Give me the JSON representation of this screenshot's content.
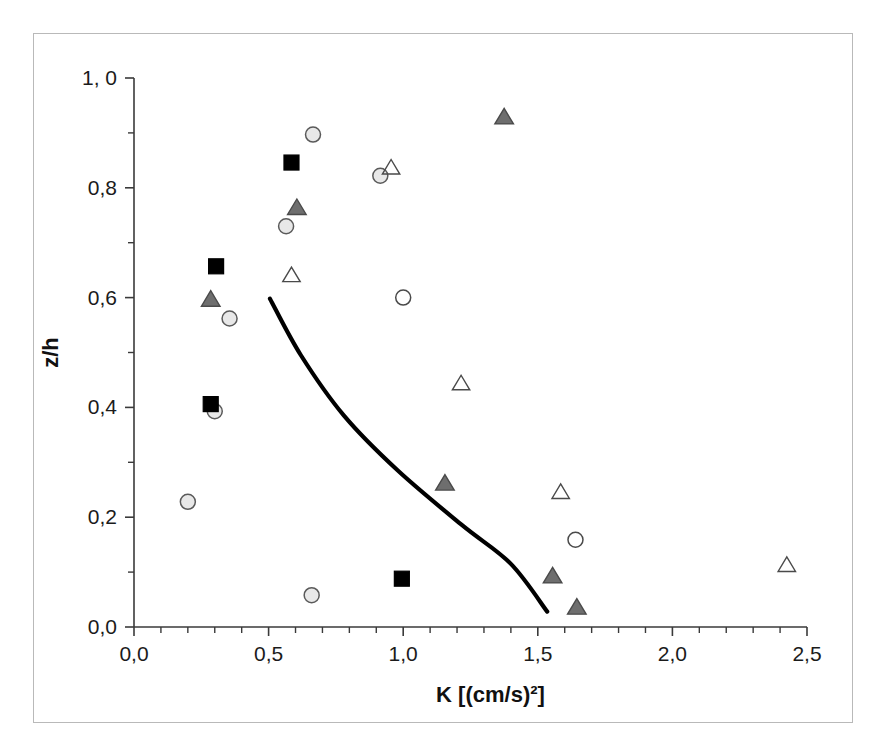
{
  "figure": {
    "background_color": "#ffffff",
    "frame_color": "#b9b9b9"
  },
  "chart_data": {
    "type": "scatter",
    "title": "",
    "subtitle": "",
    "xlabel": "K [(cm/s)²]",
    "ylabel": "z/h",
    "xlim": [
      0.0,
      2.5
    ],
    "ylim": [
      0.0,
      1.0
    ],
    "grid": false,
    "legend": null,
    "x_tick_labels": [
      "0,0",
      "0,5",
      "1,0",
      "1,5",
      "2,0",
      "2,5"
    ],
    "x_tick_values": [
      0.0,
      0.5,
      1.0,
      1.5,
      2.0,
      2.5
    ],
    "x_minor_step": 0.1,
    "y_tick_labels": [
      "0,0",
      "0,2",
      "0,4",
      "0,6",
      "0,8",
      "1, 0"
    ],
    "y_tick_values": [
      0.0,
      0.2,
      0.4,
      0.6,
      0.8,
      1.0
    ],
    "y_minor_step": 0.1,
    "series": [
      {
        "name": "light-gray-filled-circle",
        "marker": "circle",
        "fill": "#e8e8e8",
        "stroke": "#5a5a5a",
        "size": 15,
        "points": [
          {
            "x": 0.2,
            "y": 0.228
          },
          {
            "x": 0.3,
            "y": 0.393
          },
          {
            "x": 0.355,
            "y": 0.562
          },
          {
            "x": 0.565,
            "y": 0.73
          },
          {
            "x": 0.665,
            "y": 0.897
          },
          {
            "x": 0.66,
            "y": 0.058
          },
          {
            "x": 0.915,
            "y": 0.822
          }
        ]
      },
      {
        "name": "open-circle",
        "marker": "circle",
        "fill": "none",
        "stroke": "#4a4a4a",
        "size": 15,
        "points": [
          {
            "x": 1.0,
            "y": 0.6
          },
          {
            "x": 1.64,
            "y": 0.159
          }
        ]
      },
      {
        "name": "black-filled-square",
        "marker": "square",
        "fill": "#000000",
        "stroke": "#000000",
        "size": 15,
        "points": [
          {
            "x": 0.285,
            "y": 0.406
          },
          {
            "x": 0.305,
            "y": 0.657
          },
          {
            "x": 0.585,
            "y": 0.846
          },
          {
            "x": 0.995,
            "y": 0.088
          }
        ]
      },
      {
        "name": "gray-filled-triangle",
        "marker": "triangle",
        "fill": "#6e6e6e",
        "stroke": "#4a4a4a",
        "size": 16,
        "points": [
          {
            "x": 0.285,
            "y": 0.596
          },
          {
            "x": 0.605,
            "y": 0.763
          },
          {
            "x": 1.155,
            "y": 0.261
          },
          {
            "x": 1.375,
            "y": 0.928
          },
          {
            "x": 1.555,
            "y": 0.092
          },
          {
            "x": 1.645,
            "y": 0.035
          }
        ]
      },
      {
        "name": "open-triangle",
        "marker": "triangle",
        "fill": "none",
        "stroke": "#4a4a4a",
        "size": 15,
        "points": [
          {
            "x": 0.585,
            "y": 0.64
          },
          {
            "x": 0.955,
            "y": 0.836
          },
          {
            "x": 1.215,
            "y": 0.443
          },
          {
            "x": 1.585,
            "y": 0.245
          },
          {
            "x": 2.425,
            "y": 0.112
          }
        ]
      }
    ],
    "fit_curve": {
      "name": "model-curve",
      "color": "#000000",
      "points": [
        {
          "x": 0.505,
          "y": 0.598
        },
        {
          "x": 0.62,
          "y": 0.495
        },
        {
          "x": 0.78,
          "y": 0.385
        },
        {
          "x": 0.98,
          "y": 0.285
        },
        {
          "x": 1.22,
          "y": 0.185
        },
        {
          "x": 1.4,
          "y": 0.115
        },
        {
          "x": 1.535,
          "y": 0.028
        }
      ]
    }
  }
}
